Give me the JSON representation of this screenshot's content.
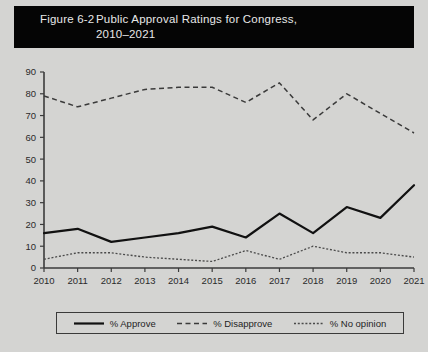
{
  "figure": {
    "number": "Figure 6-2",
    "title_line1": "Public Approval Ratings for Congress,",
    "title_line2": "2010–2021",
    "banner_color": "#050505",
    "background_color": "#d4d4d2"
  },
  "legend": {
    "items": [
      {
        "label": "% Approve",
        "style": "solid",
        "color": "#111111"
      },
      {
        "label": "% Disapprove",
        "style": "dashed",
        "color": "#3a3a3a"
      },
      {
        "label": "% No opinion",
        "style": "dotted",
        "color": "#4a4a4a"
      }
    ]
  },
  "chart_data": {
    "type": "line",
    "title": "Public Approval Ratings for Congress, 2010–2021",
    "xlabel": "",
    "ylabel": "",
    "grid": false,
    "legend_position": "bottom",
    "categories": [
      "2010",
      "2011",
      "2012",
      "2013",
      "2014",
      "2015",
      "2016",
      "2017",
      "2018",
      "2019",
      "2020",
      "2021"
    ],
    "x": [
      2010,
      2011,
      2012,
      2013,
      2014,
      2015,
      2016,
      2017,
      2018,
      2019,
      2020,
      2021
    ],
    "xlim": [
      2010,
      2021
    ],
    "ylim": [
      0,
      90
    ],
    "yticks": [
      0,
      10,
      20,
      30,
      40,
      50,
      60,
      70,
      80,
      90
    ],
    "xticks": [
      "2010",
      "2011",
      "2012",
      "2013",
      "2014",
      "2015",
      "2016",
      "2017",
      "2018",
      "2019",
      "2020",
      "2021"
    ],
    "series": [
      {
        "name": "% Approve",
        "style": "solid",
        "values": [
          16,
          18,
          12,
          14,
          16,
          19,
          14,
          25,
          16,
          28,
          23,
          38
        ]
      },
      {
        "name": "% Disapprove",
        "style": "dashed",
        "values": [
          79,
          74,
          78,
          82,
          83,
          83,
          76,
          85,
          68,
          80,
          71,
          62
        ]
      },
      {
        "name": "% No opinion",
        "style": "dotted",
        "values": [
          4,
          7,
          7,
          5,
          4,
          3,
          8,
          4,
          10,
          7,
          7,
          5
        ]
      }
    ]
  }
}
